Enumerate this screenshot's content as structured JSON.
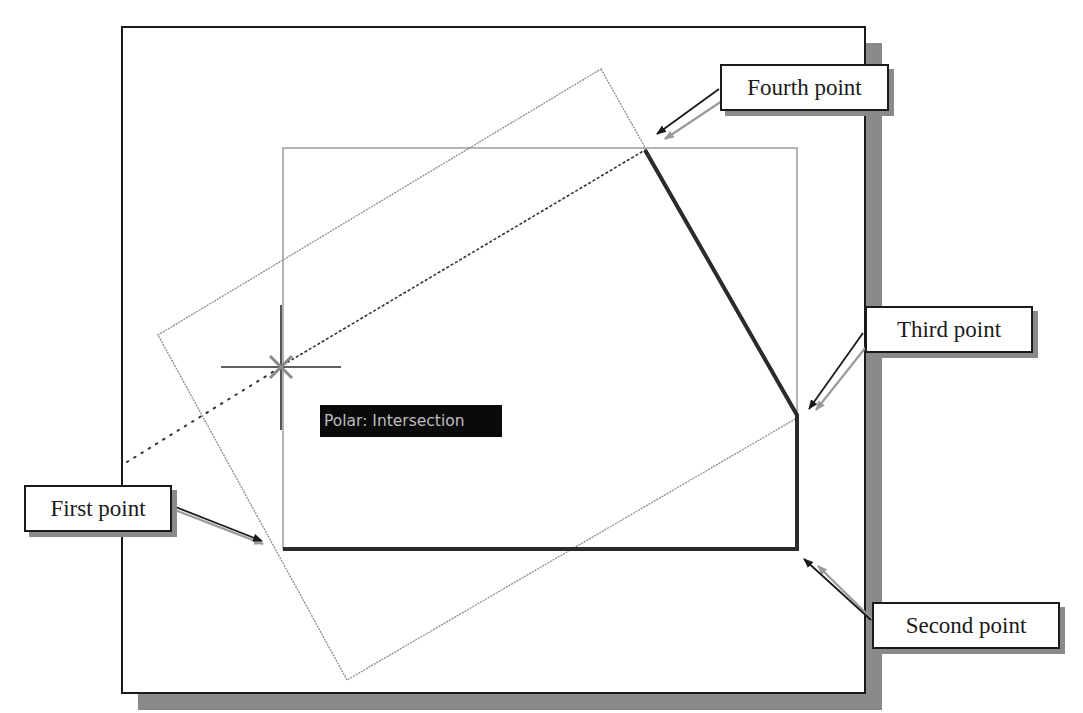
{
  "figure": {
    "colors": {
      "frame": "#1a1a1a",
      "shadow": "#8a8a8a",
      "thin_line": "#8c8c8c",
      "polyline": "#2b2b2b",
      "tooltip_bg": "#0a0a0a",
      "tooltip_text": "#bdbdbd"
    }
  },
  "tooltip": {
    "text": "Polar: Intersection"
  },
  "callouts": {
    "first_point": "First point",
    "second_point": "Second point",
    "third_point": "Third point",
    "fourth_point": "Fourth point"
  },
  "geometry": {
    "viewport_frame": {
      "x1": 122,
      "y1": 27,
      "x2": 865,
      "y2": 693
    },
    "inner_rectangle": {
      "x1": 283,
      "y1": 148,
      "x2": 797,
      "y2": 549
    },
    "rotated_rectangle": [
      [
        601,
        69
      ],
      [
        797,
        418
      ],
      [
        347,
        680
      ],
      [
        158,
        335
      ]
    ],
    "polyline_points": [
      [
        283,
        549
      ],
      [
        797,
        549
      ],
      [
        797,
        415
      ],
      [
        645,
        150
      ]
    ],
    "crosshair": {
      "x": 281,
      "y": 367
    }
  }
}
